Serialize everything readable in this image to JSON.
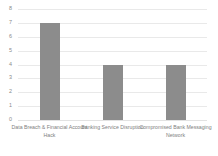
{
  "chart_data": {
    "type": "bar",
    "title": "",
    "subtitle": "",
    "xlabel": "",
    "ylabel": "",
    "categories": [
      "Data Breach & Financial Account Hack",
      "Banking Service Disruption",
      "Compromised Bank Messaging Network"
    ],
    "values": [
      7,
      4,
      4
    ],
    "ylim": [
      0,
      8
    ],
    "yticks": [
      0,
      1,
      2,
      3,
      4,
      5,
      6,
      7,
      8
    ],
    "ytick_labels": [
      "0",
      "1",
      "2",
      "3",
      "4",
      "5",
      "6",
      "7",
      "8"
    ],
    "grid": true,
    "grid_axis": "y",
    "legend": false,
    "legend_position": "none",
    "bar_color": "#8c8c8c",
    "gridline_color": "#e9e9e9",
    "label_color": "#808080",
    "background_color": "#ffffff"
  }
}
